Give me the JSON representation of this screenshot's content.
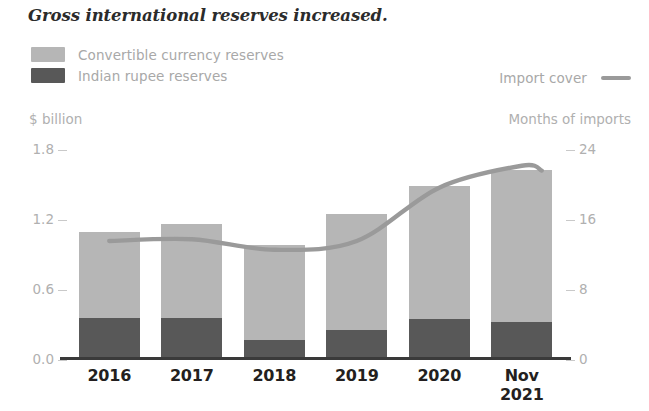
{
  "title": "Gross international reserves increased.",
  "legend": {
    "series": [
      {
        "label": "Convertible currency reserves",
        "color": "#b6b6b6",
        "marker": "swatch"
      },
      {
        "label": "Indian rupee reserves",
        "color": "#585858",
        "marker": "swatch"
      }
    ],
    "line_entry": {
      "label": "Import cover",
      "color": "#9a9a9a",
      "marker": "line"
    }
  },
  "axes": {
    "left_caption": "$ billion",
    "right_caption": "Months of imports",
    "left_ticks": [
      "1.8",
      "1.2",
      "0.6",
      "0.0"
    ],
    "right_ticks": [
      "24",
      "16",
      "8",
      "0"
    ]
  },
  "chart_data": {
    "type": "bar",
    "title": "Gross international reserves increased.",
    "xlabel": "",
    "ylabel": "$ billion",
    "y2label": "Months of imports",
    "categories": [
      "2016",
      "2017",
      "2018",
      "2019",
      "2020",
      "Nov 2021"
    ],
    "category_lines": [
      [
        "2016"
      ],
      [
        "2017"
      ],
      [
        "2018"
      ],
      [
        "2019"
      ],
      [
        "2020"
      ],
      [
        "Nov",
        "2021"
      ]
    ],
    "ylim": [
      0.0,
      1.8
    ],
    "y2lim": [
      0,
      24
    ],
    "yticks": [
      0.0,
      0.6,
      1.2,
      1.8
    ],
    "y2ticks": [
      0,
      8,
      16,
      24
    ],
    "grid": false,
    "legend_position": "top",
    "stacked": true,
    "series": [
      {
        "name": "Indian rupee reserves",
        "axis": "left",
        "color": "#585858",
        "values": [
          0.36,
          0.36,
          0.17,
          0.26,
          0.35,
          0.33
        ]
      },
      {
        "name": "Convertible currency reserves",
        "axis": "left",
        "color": "#b6b6b6",
        "values": [
          0.74,
          0.81,
          0.82,
          0.99,
          1.14,
          1.3
        ]
      },
      {
        "name": "Import cover",
        "axis": "right",
        "type": "line",
        "color": "#9a9a9a",
        "values": [
          13.6,
          13.8,
          12.6,
          13.6,
          19.7,
          22.2
        ]
      }
    ],
    "totals": [
      1.1,
      1.17,
      0.99,
      1.25,
      1.49,
      1.63
    ]
  }
}
